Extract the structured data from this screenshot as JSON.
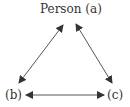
{
  "diagram": {
    "nodes": [
      {
        "id": "a",
        "label": "Person (a)"
      },
      {
        "id": "b",
        "label": "(b)"
      },
      {
        "id": "c",
        "label": "(c)"
      }
    ],
    "edges": [
      {
        "from": "a",
        "to": "b",
        "direction": "bidirectional"
      },
      {
        "from": "a",
        "to": "c",
        "direction": "bidirectional"
      },
      {
        "from": "b",
        "to": "c",
        "direction": "bidirectional"
      }
    ],
    "colors": {
      "line": "#444444",
      "text": "#333333"
    }
  }
}
